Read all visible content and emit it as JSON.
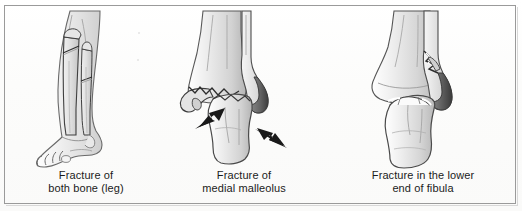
{
  "figure": {
    "type": "medical-illustration-figure",
    "background_color": "#fdfdfd",
    "border_color": "#9a9a9a",
    "bone_fill_color": "#d9d9d9",
    "bone_outline_color": "#4a4a4a",
    "arrow_color": "#1a1a1a",
    "caption_text_color": "#1b1b1b"
  },
  "panels": [
    {
      "id": "panel-1",
      "illustration_name": "lower-leg-with-tibia-and-fibula-fracture",
      "caption_line_1": "Fracture of",
      "caption_line_2": "both bone (leg)",
      "has_arrows": false
    },
    {
      "id": "panel-2",
      "illustration_name": "ankle-with-medial-malleolus-fracture",
      "caption_line_1": "Fracture of",
      "caption_line_2": "medial malleolus",
      "has_arrows": true,
      "arrow_left_name": "displacement-arrow-left",
      "arrow_right_name": "displacement-arrow-right"
    },
    {
      "id": "panel-3",
      "illustration_name": "ankle-with-lower-fibula-fracture",
      "caption_line_1": "Fracture in the lower",
      "caption_line_2": "end of fibula",
      "has_arrows": false
    }
  ]
}
